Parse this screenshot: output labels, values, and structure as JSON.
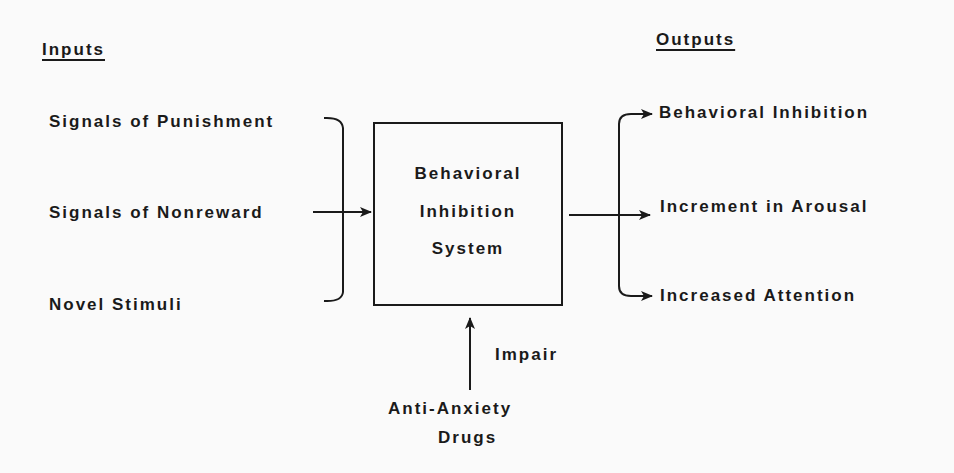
{
  "inputs": {
    "header": "Inputs",
    "items": [
      "Signals of Punishment",
      "Signals of Nonreward",
      "Novel Stimuli"
    ]
  },
  "system": {
    "lines": [
      "Behavioral",
      "Inhibition",
      "System"
    ]
  },
  "outputs": {
    "header": "Outputs",
    "items": [
      "Behavioral Inhibition",
      "Increment in Arousal",
      "Increased Attention"
    ]
  },
  "modulator": {
    "arrow_label": "Impair",
    "source_lines": [
      "Anti-Anxiety",
      "Drugs"
    ]
  },
  "colors": {
    "ink": "#1a1a1a",
    "paper": "#fafafa"
  }
}
